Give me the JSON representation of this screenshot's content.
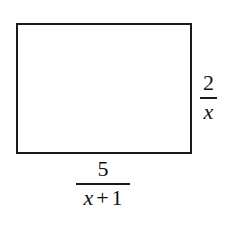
{
  "diagram": {
    "shape": "rectangle",
    "height_label": {
      "numerator": "2",
      "denominator": "x"
    },
    "width_label": {
      "numerator": "5",
      "denominator_var": "x",
      "denominator_op": "+",
      "denominator_const": "1"
    },
    "stroke_color": "#1a1a1a",
    "background": "#ffffff"
  }
}
